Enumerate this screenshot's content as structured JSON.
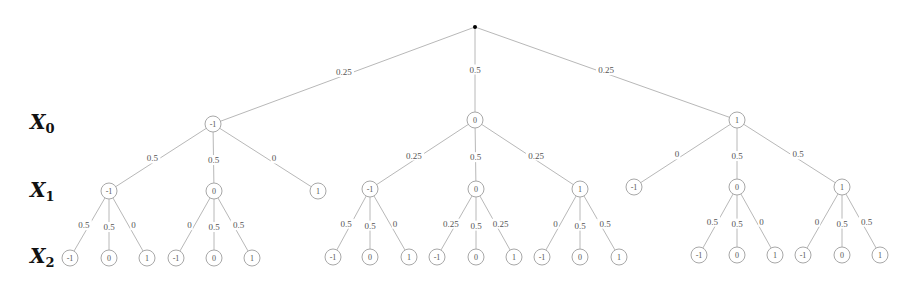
{
  "diagram": {
    "type": "probability-tree",
    "root": {
      "x": 475,
      "y": 27
    },
    "level_labels": [
      {
        "var": "X",
        "sub": "0",
        "x": 30,
        "y": 112
      },
      {
        "var": "X",
        "sub": "1",
        "x": 30,
        "y": 180
      },
      {
        "var": "X",
        "sub": "2",
        "x": 30,
        "y": 246
      }
    ],
    "nodes": [
      {
        "id": "a",
        "parent": "root",
        "label": "-1",
        "x": 213,
        "y": 124,
        "prob": "0.25"
      },
      {
        "id": "b",
        "parent": "root",
        "label": "0",
        "x": 475,
        "y": 120,
        "prob": "0.5"
      },
      {
        "id": "c",
        "parent": "root",
        "label": "1",
        "x": 737,
        "y": 120,
        "prob": "0.25"
      },
      {
        "id": "a1",
        "parent": "a",
        "label": "-1",
        "x": 109,
        "y": 191,
        "prob": "0.5"
      },
      {
        "id": "a2",
        "parent": "a",
        "label": "0",
        "x": 214,
        "y": 191,
        "prob": "0.5"
      },
      {
        "id": "a3",
        "parent": "a",
        "label": "1",
        "x": 318,
        "y": 191,
        "prob": "0"
      },
      {
        "id": "b1",
        "parent": "b",
        "label": "-1",
        "x": 370,
        "y": 189,
        "prob": "0.25"
      },
      {
        "id": "b2",
        "parent": "b",
        "label": "0",
        "x": 476,
        "y": 189,
        "prob": "0.5"
      },
      {
        "id": "b3",
        "parent": "b",
        "label": "1",
        "x": 580,
        "y": 189,
        "prob": "0.25"
      },
      {
        "id": "c1",
        "parent": "c",
        "label": "-1",
        "x": 634,
        "y": 187,
        "prob": "0"
      },
      {
        "id": "c2",
        "parent": "c",
        "label": "0",
        "x": 737,
        "y": 187,
        "prob": "0.5"
      },
      {
        "id": "c3",
        "parent": "c",
        "label": "1",
        "x": 842,
        "y": 187,
        "prob": "0.5"
      },
      {
        "id": "a1a",
        "parent": "a1",
        "label": "-1",
        "x": 70,
        "y": 258,
        "prob": "0.5"
      },
      {
        "id": "a1b",
        "parent": "a1",
        "label": "0",
        "x": 109,
        "y": 258,
        "prob": "0.5"
      },
      {
        "id": "a1c",
        "parent": "a1",
        "label": "1",
        "x": 147,
        "y": 258,
        "prob": "0"
      },
      {
        "id": "a2a",
        "parent": "a2",
        "label": "-1",
        "x": 176,
        "y": 258,
        "prob": "0"
      },
      {
        "id": "a2b",
        "parent": "a2",
        "label": "0",
        "x": 214,
        "y": 258,
        "prob": "0.5"
      },
      {
        "id": "a2c",
        "parent": "a2",
        "label": "1",
        "x": 252,
        "y": 258,
        "prob": "0.5"
      },
      {
        "id": "b1a",
        "parent": "b1",
        "label": "-1",
        "x": 333,
        "y": 257,
        "prob": "0.5"
      },
      {
        "id": "b1b",
        "parent": "b1",
        "label": "0",
        "x": 370,
        "y": 257,
        "prob": "0.5"
      },
      {
        "id": "b1c",
        "parent": "b1",
        "label": "1",
        "x": 409,
        "y": 257,
        "prob": "0"
      },
      {
        "id": "b2a",
        "parent": "b2",
        "label": "-1",
        "x": 437,
        "y": 257,
        "prob": "0.25"
      },
      {
        "id": "b2b",
        "parent": "b2",
        "label": "0",
        "x": 476,
        "y": 257,
        "prob": "0.5"
      },
      {
        "id": "b2c",
        "parent": "b2",
        "label": "1",
        "x": 514,
        "y": 257,
        "prob": "0.25"
      },
      {
        "id": "b3a",
        "parent": "b3",
        "label": "-1",
        "x": 542,
        "y": 257,
        "prob": "0"
      },
      {
        "id": "b3b",
        "parent": "b3",
        "label": "0",
        "x": 580,
        "y": 257,
        "prob": "0.5"
      },
      {
        "id": "b3c",
        "parent": "b3",
        "label": "1",
        "x": 619,
        "y": 257,
        "prob": "0.5"
      },
      {
        "id": "c2a",
        "parent": "c2",
        "label": "-1",
        "x": 699,
        "y": 255,
        "prob": "0.5"
      },
      {
        "id": "c2b",
        "parent": "c2",
        "label": "0",
        "x": 737,
        "y": 255,
        "prob": "0.5"
      },
      {
        "id": "c2c",
        "parent": "c2",
        "label": "1",
        "x": 775,
        "y": 255,
        "prob": "0"
      },
      {
        "id": "c3a",
        "parent": "c3",
        "label": "-1",
        "x": 803,
        "y": 255,
        "prob": "0"
      },
      {
        "id": "c3b",
        "parent": "c3",
        "label": "0",
        "x": 842,
        "y": 255,
        "prob": "0.5"
      },
      {
        "id": "c3c",
        "parent": "c3",
        "label": "1",
        "x": 880,
        "y": 255,
        "prob": "0.5"
      }
    ]
  }
}
